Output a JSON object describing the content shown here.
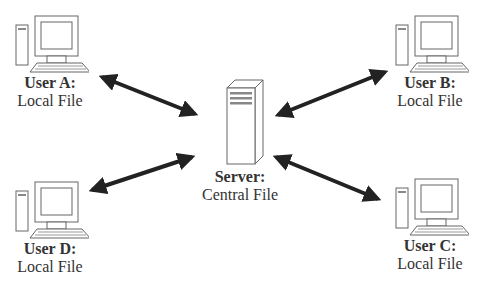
{
  "diagram": {
    "nodes": [
      {
        "id": "user-a",
        "title": "User A:",
        "subtitle": "Local File",
        "icon": "computer-icon"
      },
      {
        "id": "user-b",
        "title": "User B:",
        "subtitle": "Local File",
        "icon": "computer-icon"
      },
      {
        "id": "server",
        "title": "Server:",
        "subtitle": "Central File",
        "icon": "server-icon"
      },
      {
        "id": "user-d",
        "title": "User D:",
        "subtitle": "Local File",
        "icon": "computer-icon"
      },
      {
        "id": "user-c",
        "title": "User C:",
        "subtitle": "Local File",
        "icon": "computer-icon"
      }
    ],
    "edges": [
      {
        "from": "user-a",
        "to": "server",
        "type": "bidirectional"
      },
      {
        "from": "user-b",
        "to": "server",
        "type": "bidirectional"
      },
      {
        "from": "user-d",
        "to": "server",
        "type": "bidirectional"
      },
      {
        "from": "user-c",
        "to": "server",
        "type": "bidirectional"
      }
    ],
    "colors": {
      "line": "#222222",
      "icon_stroke": "#555555",
      "text": "#333333"
    }
  }
}
